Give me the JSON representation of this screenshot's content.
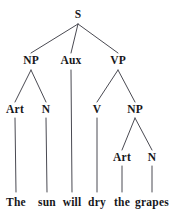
{
  "figure": {
    "kind": "phrase-structure-tree",
    "sentence": "The sun will dry the grapes",
    "background_color": "#ffffff",
    "line_color": "#4a4a52",
    "text_color": "#17171a"
  },
  "nodes": {
    "root": {
      "label": "S",
      "x": 78,
      "y": 15
    },
    "level2": [
      {
        "label": "NP",
        "x": 31,
        "y": 61
      },
      {
        "label": "Aux",
        "x": 71,
        "y": 61
      },
      {
        "label": "VP",
        "x": 118,
        "y": 61
      }
    ],
    "level3": [
      {
        "label": "Art",
        "x": 15,
        "y": 110
      },
      {
        "label": "N",
        "x": 46,
        "y": 110
      },
      {
        "label": "V",
        "x": 97,
        "y": 110
      },
      {
        "label": "NP",
        "x": 135,
        "y": 110
      }
    ],
    "level4": [
      {
        "label": "Art",
        "x": 122,
        "y": 158
      },
      {
        "label": "N",
        "x": 152,
        "y": 158
      }
    ],
    "words": [
      {
        "label": "The",
        "x": 16,
        "y": 203
      },
      {
        "label": "sun",
        "x": 47,
        "y": 203
      },
      {
        "label": "will",
        "x": 72,
        "y": 203
      },
      {
        "label": "dry",
        "x": 97,
        "y": 203
      },
      {
        "label": "the",
        "x": 122,
        "y": 203
      },
      {
        "label": "grapes",
        "x": 152,
        "y": 203
      }
    ]
  },
  "edges": [
    {
      "name": "s-to-np",
      "x1": 78,
      "y1": 24,
      "x2": 31,
      "y2": 53
    },
    {
      "name": "s-to-aux",
      "x1": 78,
      "y1": 24,
      "x2": 71,
      "y2": 53
    },
    {
      "name": "s-to-vp",
      "x1": 78,
      "y1": 24,
      "x2": 118,
      "y2": 53
    },
    {
      "name": "np1-to-art",
      "x1": 31,
      "y1": 70,
      "x2": 15,
      "y2": 102
    },
    {
      "name": "np1-to-n",
      "x1": 31,
      "y1": 70,
      "x2": 46,
      "y2": 102
    },
    {
      "name": "aux-to-will",
      "x1": 71,
      "y1": 70,
      "x2": 72,
      "y2": 192
    },
    {
      "name": "vp-to-v",
      "x1": 118,
      "y1": 70,
      "x2": 97,
      "y2": 102
    },
    {
      "name": "vp-to-np2",
      "x1": 118,
      "y1": 70,
      "x2": 135,
      "y2": 102
    },
    {
      "name": "art1-to-the",
      "x1": 15,
      "y1": 118,
      "x2": 16,
      "y2": 192
    },
    {
      "name": "n1-to-sun",
      "x1": 46,
      "y1": 118,
      "x2": 47,
      "y2": 192
    },
    {
      "name": "v-to-dry",
      "x1": 97,
      "y1": 118,
      "x2": 97,
      "y2": 192
    },
    {
      "name": "np2-to-art2",
      "x1": 135,
      "y1": 118,
      "x2": 122,
      "y2": 150
    },
    {
      "name": "np2-to-n2",
      "x1": 135,
      "y1": 118,
      "x2": 152,
      "y2": 150
    },
    {
      "name": "art2-to-the",
      "x1": 122,
      "y1": 166,
      "x2": 122,
      "y2": 192
    },
    {
      "name": "n2-to-grapes",
      "x1": 152,
      "y1": 166,
      "x2": 152,
      "y2": 192
    }
  ]
}
